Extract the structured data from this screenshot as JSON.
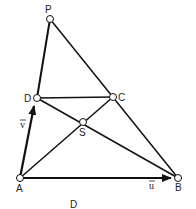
{
  "diagram": {
    "caption": "D",
    "points": {
      "P": {
        "label": "P",
        "x": 50,
        "y": 19
      },
      "D": {
        "label": "D",
        "x": 37,
        "y": 98
      },
      "C": {
        "label": "C",
        "x": 113,
        "y": 97
      },
      "S": {
        "label": "S",
        "x": 83,
        "y": 122
      },
      "A": {
        "label": "A",
        "x": 20,
        "y": 178
      },
      "B": {
        "label": "B",
        "x": 178,
        "y": 178
      }
    },
    "vectors": {
      "u": {
        "label": "u",
        "from": "A",
        "to": "B"
      },
      "v": {
        "label": "v",
        "from": "A",
        "to": "D"
      }
    },
    "segments": [
      [
        "P",
        "D"
      ],
      [
        "P",
        "B"
      ],
      [
        "D",
        "C"
      ],
      [
        "D",
        "B"
      ],
      [
        "A",
        "C"
      ],
      [
        "A",
        "D"
      ],
      [
        "A",
        "B"
      ],
      [
        "C",
        "B"
      ]
    ]
  }
}
